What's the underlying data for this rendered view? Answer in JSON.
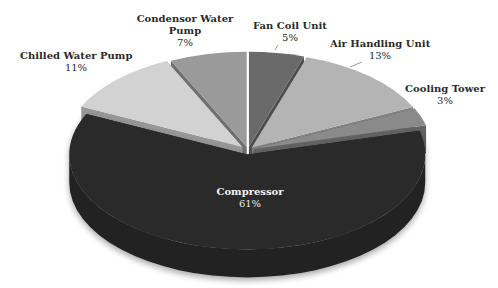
{
  "chart_data": {
    "type": "pie",
    "style": "3d-exploded",
    "title": "",
    "categories": [
      "Fan Coil Unit",
      "Air Handling Unit",
      "Cooling Tower",
      "Compressor",
      "Chilled Water Pump",
      "Condensor Water Pump"
    ],
    "values": [
      5,
      13,
      3,
      61,
      11,
      7
    ],
    "unit": "%",
    "colors": [
      "#6a6a6a",
      "#b4b4b4",
      "#8a8a8a",
      "#2b2b2b",
      "#d2d2d2",
      "#9a9a9a"
    ],
    "legend": "none (data labels)",
    "labels": [
      {
        "name": "Fan Coil Unit",
        "pct": "5%"
      },
      {
        "name": "Air Handling Unit",
        "pct": "13%"
      },
      {
        "name": "Cooling Tower",
        "pct": "3%"
      },
      {
        "name": "Compressor",
        "pct": "61%"
      },
      {
        "name": "Chilled Water Pump",
        "pct": "11%"
      },
      {
        "name": "Condensor Water Pump",
        "pct": "7%"
      }
    ]
  },
  "labels": {
    "fan_coil": {
      "name": "Fan Coil Unit",
      "pct": "5%"
    },
    "ahu": {
      "name": "Air Handling Unit",
      "pct": "13%"
    },
    "cooling_tower": {
      "name": "Cooling Tower",
      "pct": "3%"
    },
    "compressor": {
      "name": "Compressor",
      "pct": "61%"
    },
    "chw_pump": {
      "name": "Chilled Water Pump",
      "pct": "11%"
    },
    "cond_pump_line1": "Condensor Water",
    "cond_pump_line2": "Pump",
    "cond_pump_pct": "7%"
  }
}
